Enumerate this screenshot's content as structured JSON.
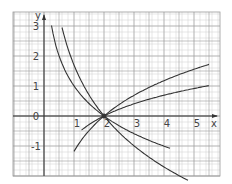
{
  "chart_data": {
    "type": "line",
    "title": "",
    "xlabel": "x",
    "ylabel": "y",
    "xlim": [
      -1,
      5.8
    ],
    "ylim": [
      -2,
      3.3
    ],
    "grid": true,
    "x_ticks": [
      "1",
      "2",
      "3",
      "4",
      "5"
    ],
    "y_ticks": [
      "3",
      "2",
      "1",
      "0",
      "-1"
    ],
    "intersection_point": {
      "x": 2,
      "y": 0
    },
    "series": [
      {
        "name": "increasing-steep",
        "description": "logarithmic curve through (2,0), rising to ~1.7 at x=5.5",
        "k": 1.7,
        "x_start": 1.0,
        "x_end": 5.5
      },
      {
        "name": "increasing-shallow",
        "description": "logarithmic curve through (2,0), rising to ~1.0 at x=5.5",
        "k": 1.0,
        "x_start": 1.25,
        "x_end": 5.5
      },
      {
        "name": "decreasing-steep",
        "description": "logarithmic curve through (2,0), falling from ~3 near x=0.25 to ~-1.3 at x=4.2",
        "k": -1.45,
        "x_start": 0.25,
        "x_end": 4.2
      },
      {
        "name": "decreasing-shallow",
        "description": "logarithmic curve through (2,0), falling from ~3 near x=0.6 to ~-0.9 at x=4.8",
        "k": -2.45,
        "x_start": 0.6,
        "x_end": 4.8
      }
    ]
  },
  "labels": {
    "x_axis": "x",
    "y_axis": "y",
    "origin": "0"
  },
  "colors": {
    "grid_minor": "#cfcfcf",
    "grid_major": "#9a9a9a",
    "axis": "#333333",
    "curve": "#333333"
  }
}
